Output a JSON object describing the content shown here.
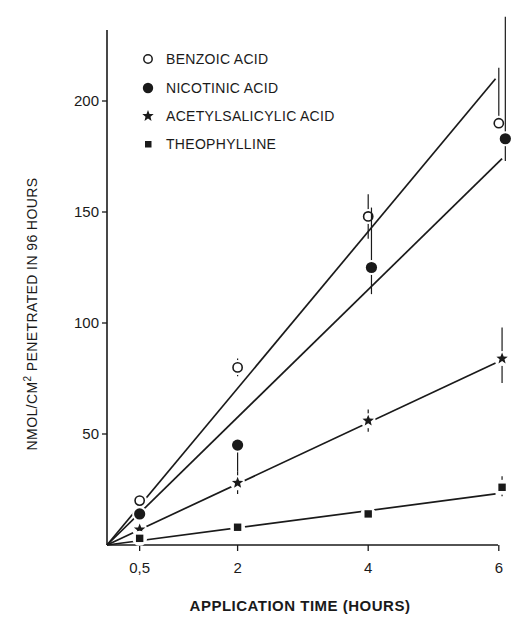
{
  "chart_data": {
    "type": "scatter",
    "title": "",
    "xlabel": "APPLICATION TIME (HOURS)",
    "ylabel": "NMOL/CM2 PENETRATED IN 96 HOURS",
    "ylabel_parts": {
      "before": "NMOL/CM",
      "sup": "2",
      "after": " PENETRATED IN 96 HOURS"
    },
    "x_ticks": [
      {
        "value": 0.5,
        "label": "0,5"
      },
      {
        "value": 2,
        "label": "2"
      },
      {
        "value": 4,
        "label": "4"
      },
      {
        "value": 6,
        "label": "6"
      }
    ],
    "y_ticks": [
      {
        "value": 50,
        "label": "50"
      },
      {
        "value": 100,
        "label": "100"
      },
      {
        "value": 150,
        "label": "150"
      },
      {
        "value": 200,
        "label": "200"
      }
    ],
    "xlim": [
      0,
      6.3
    ],
    "ylim": [
      0,
      232
    ],
    "grid": false,
    "legend_position": "upper-left",
    "series": [
      {
        "name": "BENZOIC ACID",
        "marker": "open-circle",
        "x": [
          0.5,
          2,
          4,
          6
        ],
        "values": [
          20,
          80,
          148,
          190
        ],
        "error": [
          [
            0,
            0
          ],
          [
            4,
            4
          ],
          [
            10,
            10
          ],
          [
            0,
            25
          ]
        ],
        "fit_line": {
          "x0": 0,
          "y0": 0,
          "x1": 5.95,
          "y1": 210
        }
      },
      {
        "name": "NICOTINIC ACID",
        "marker": "filled-circle",
        "x": [
          0.5,
          2,
          4.05,
          6.1
        ],
        "values": [
          14,
          45,
          125,
          183
        ],
        "error": [
          [
            0,
            0
          ],
          [
            12,
            0
          ],
          [
            12,
            27
          ],
          [
            10,
            55
          ]
        ],
        "fit_line": {
          "x0": 0,
          "y0": 0,
          "x1": 6.05,
          "y1": 174
        }
      },
      {
        "name": "ACETYLSALICYLIC ACID",
        "marker": "star",
        "x": [
          0.5,
          2,
          4,
          6.05
        ],
        "values": [
          7,
          28,
          56,
          84
        ],
        "error": [
          [
            0,
            0
          ],
          [
            5,
            5
          ],
          [
            5,
            5
          ],
          [
            11,
            14
          ]
        ],
        "fit_line": {
          "x0": 0,
          "y0": 0,
          "x1": 5.95,
          "y1": 82
        }
      },
      {
        "name": "THEOPHYLLINE",
        "marker": "filled-square",
        "x": [
          0.5,
          2,
          4,
          6.05
        ],
        "values": [
          3,
          8,
          14,
          26
        ],
        "error": [
          [
            0,
            0
          ],
          [
            0,
            0
          ],
          [
            0,
            0
          ],
          [
            4,
            5
          ]
        ],
        "fit_line": {
          "x0": 0,
          "y0": 0,
          "x1": 5.95,
          "y1": 23
        }
      }
    ]
  },
  "legend": {
    "items": [
      {
        "label": "BENZOIC ACID",
        "marker": "open-circle"
      },
      {
        "label": "NICOTINIC ACID",
        "marker": "filled-circle"
      },
      {
        "label": "ACETYLSALICYLIC ACID",
        "marker": "star"
      },
      {
        "label": "THEOPHYLLINE",
        "marker": "filled-square"
      }
    ]
  },
  "colors": {
    "ink": "#1a1a1a",
    "background": "#ffffff"
  }
}
